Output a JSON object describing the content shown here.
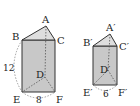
{
  "figure": {
    "type": "two similar triangular prisms",
    "prism_left": {
      "vertices": {
        "A": {
          "label": "A",
          "x": 46,
          "y": 26
        },
        "B": {
          "label": "B",
          "x": 22,
          "y": 40
        },
        "C": {
          "label": "C",
          "x": 55,
          "y": 40
        },
        "D": {
          "label": "D",
          "x": 45,
          "y": 77
        },
        "E": {
          "label": "E",
          "x": 22,
          "y": 92
        },
        "F": {
          "label": "F",
          "x": 55,
          "y": 92
        }
      },
      "dimensions": {
        "height": {
          "label": "12",
          "between": "B-E"
        },
        "base": {
          "label": "8",
          "between": "E-F"
        }
      }
    },
    "prism_right": {
      "vertices": {
        "A": {
          "label": "A′",
          "x": 110,
          "y": 34
        },
        "B": {
          "label": "B′",
          "x": 93,
          "y": 46
        },
        "C": {
          "label": "C′",
          "x": 117,
          "y": 46
        },
        "D": {
          "label": "D′",
          "x": 108,
          "y": 70
        },
        "E": {
          "label": "E′",
          "x": 93,
          "y": 85
        },
        "F": {
          "label": "F′",
          "x": 117,
          "y": 85
        }
      },
      "dimensions": {
        "base": {
          "label": "6",
          "between": "E′-F′"
        }
      }
    },
    "colors": {
      "face_fill": "#c8c8c8",
      "top_fill": "#dedede",
      "edge": "#333333",
      "hidden_edge": "#555555"
    }
  }
}
